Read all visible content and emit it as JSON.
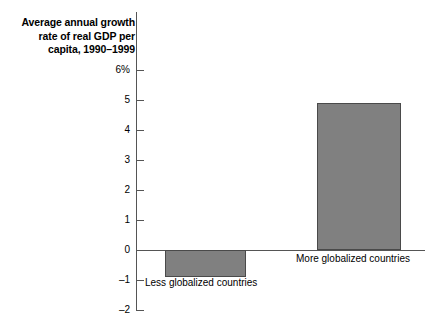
{
  "chart_data": {
    "type": "bar",
    "title": "Average annual growth rate of real GDP per capita, 1990–1999",
    "xlabel": "",
    "ylabel": "",
    "categories": [
      "Less globalized countries",
      "More globalized countries"
    ],
    "values": [
      -0.9,
      4.9
    ],
    "ylim": [
      -2,
      6
    ],
    "yticks": [
      6,
      5,
      4,
      3,
      2,
      1,
      0,
      -1,
      -2
    ],
    "ytick_labels": [
      "6%",
      "5",
      "4",
      "3",
      "2",
      "1",
      "0",
      "–1",
      "–2"
    ],
    "grid": false,
    "legend": null,
    "bar_color": "#808080",
    "bar_edge_color": "#4a4a4a",
    "axis_color": "#555555",
    "text_color": "#000000",
    "background": "#ffffff"
  },
  "labels": {
    "less_globalized": "Less globalized countries",
    "more_globalized": "More globalized countries"
  }
}
